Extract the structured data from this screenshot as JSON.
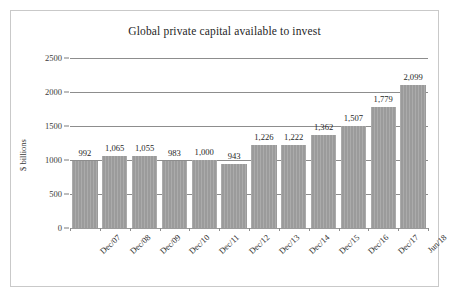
{
  "chart_data": {
    "type": "bar",
    "title": "Global private capital available to invest",
    "xlabel": "",
    "ylabel": "$ billions",
    "ylim": [
      0,
      2500
    ],
    "yticks": [
      0,
      500,
      1000,
      1500,
      2000,
      2500
    ],
    "ytick_labels": [
      "0",
      "500",
      "1000",
      "1500",
      "2000",
      "2500"
    ],
    "grid": true,
    "legend": null,
    "categories": [
      "Dec/07",
      "Dec/08",
      "Dec/09",
      "Dec/10",
      "Dec/11",
      "Dec/12",
      "Dec/13",
      "Dec/14",
      "Dec/15",
      "Dec/16",
      "Dec/17",
      "Jun/18"
    ],
    "values": [
      992,
      1065,
      1055,
      983,
      1000,
      943,
      1226,
      1222,
      1362,
      1507,
      1779,
      2099
    ],
    "value_labels": [
      "992",
      "1,065",
      "1,055",
      "983",
      "1,000",
      "943",
      "1,226",
      "1,222",
      "1,362",
      "1,507",
      "1,779",
      "2,099"
    ],
    "bar_color": "#9b9b9b",
    "gridline_color": "#8d8d8d",
    "frame_color": "#c9c9c9",
    "background_color": "#ffffff",
    "text_color": "#262626"
  }
}
